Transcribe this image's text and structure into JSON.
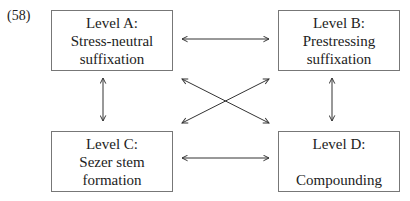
{
  "example_number": "(58)",
  "boxes": {
    "a": {
      "lines": [
        "Level A:",
        "Stress-neutral",
        "suffixation"
      ]
    },
    "b": {
      "lines": [
        "Level B:",
        "Prestressing",
        "suffixation"
      ]
    },
    "c": {
      "lines": [
        "Level C:",
        "Sezer stem",
        "formation"
      ]
    },
    "d": {
      "lines": [
        "Level D:",
        "",
        "Compounding"
      ]
    }
  },
  "arrows": [
    {
      "from": "A",
      "to": "B",
      "type": "bidirectional",
      "orientation": "horizontal"
    },
    {
      "from": "C",
      "to": "D",
      "type": "bidirectional",
      "orientation": "horizontal"
    },
    {
      "from": "A",
      "to": "C",
      "type": "bidirectional",
      "orientation": "vertical"
    },
    {
      "from": "B",
      "to": "D",
      "type": "bidirectional",
      "orientation": "vertical"
    },
    {
      "from": "A",
      "to": "D",
      "type": "bidirectional",
      "orientation": "diagonal"
    },
    {
      "from": "B",
      "to": "C",
      "type": "bidirectional",
      "orientation": "diagonal"
    }
  ],
  "colors": {
    "border": "#777777",
    "arrow": "#333333",
    "text": "#222222"
  }
}
